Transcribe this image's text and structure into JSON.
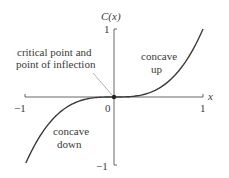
{
  "chart_data": {
    "type": "line",
    "title": "",
    "xlabel": "x",
    "ylabel": "C(x)",
    "function": "C(x) = x^3",
    "xlim": [
      -1,
      1
    ],
    "ylim": [
      -1,
      1
    ],
    "grid": false,
    "legend": null,
    "x_ticks": [
      "-1",
      "0",
      "1"
    ],
    "y_ticks": [
      "1",
      "-1"
    ],
    "series": [
      {
        "name": "C(x)",
        "x": [
          -1,
          -0.75,
          -0.5,
          -0.25,
          0,
          0.25,
          0.5,
          0.75,
          1
        ],
        "y": [
          -1,
          -0.42,
          -0.125,
          -0.016,
          0,
          0.016,
          0.125,
          0.42,
          1
        ]
      }
    ],
    "annotations": [
      {
        "text": "critical point and point of inflection",
        "x": 0,
        "y": 0,
        "arrow": true
      },
      {
        "text": "concave up",
        "x": 0.55,
        "y": 0.6
      },
      {
        "text": "concave down",
        "x": -0.55,
        "y": -0.55
      }
    ],
    "marked_points": [
      {
        "x": 0,
        "y": 0
      }
    ]
  },
  "labels": {
    "ylabel": "C(x)",
    "xlabel": "x",
    "x_neg_one": "−1",
    "x_zero": "0",
    "x_one": "1",
    "y_one": "1",
    "y_neg_one": "−1",
    "annot_cp_line1": "critical point and",
    "annot_cp_line2": "point of inflection",
    "concave_up_line1": "concave",
    "concave_up_line2": "up",
    "concave_down_line1": "concave",
    "concave_down_line2": "down"
  },
  "colors": {
    "curve": "#3a3a3a",
    "axis": "#555555",
    "leader": "#aaaaaa"
  }
}
